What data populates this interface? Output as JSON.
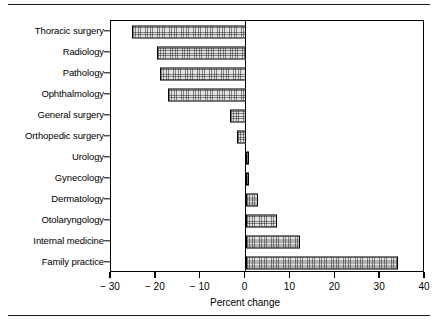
{
  "chart_data": {
    "type": "bar",
    "orientation": "horizontal",
    "title": "",
    "subtitle": "",
    "xlabel": "Percent change",
    "ylabel": "",
    "xlim": [
      -30,
      40
    ],
    "xticks": [
      -30,
      -20,
      -10,
      0,
      10,
      20,
      30,
      40
    ],
    "xtick_labels": [
      "− 30",
      "− 20",
      "− 10",
      "0",
      "10",
      "20",
      "30",
      "40"
    ],
    "grid": false,
    "legend": null,
    "zero_reference_line": 0,
    "categories": [
      "Thoracic surgery",
      "Radiology",
      "Pathology",
      "Ophthalmology",
      "General surgery",
      "Orthopedic surgery",
      "Urology",
      "Gynecology",
      "Dermatology",
      "Otolaryngology",
      "Internal medicine",
      "Family practice"
    ],
    "values": [
      -25.3,
      -19.8,
      -19.0,
      -17.2,
      -3.4,
      -1.9,
      0.7,
      0.8,
      2.8,
      6.9,
      12.2,
      34.0
    ],
    "bar_fill": "#e2e2e2",
    "bar_edge": "#000000",
    "bar_hatch": "dotted-grid"
  },
  "figure": {
    "top_rule": true,
    "bottom_rule": true,
    "background": "#ffffff",
    "frame_color": "#000000"
  }
}
